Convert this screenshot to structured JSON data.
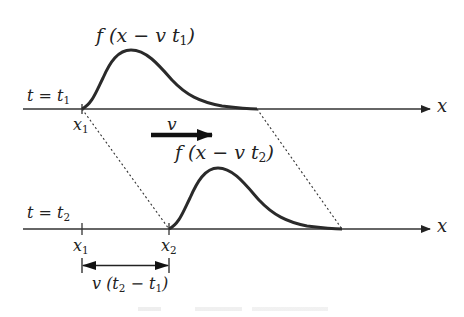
{
  "figure": {
    "colors": {
      "ink": "#222222",
      "background": "#ffffff"
    }
  },
  "time1": {
    "axis_label": "t = t",
    "axis_label_sub": "1",
    "x_axis_label": "x",
    "pulse_label_pre": "f (x − v t",
    "pulse_label_sub": "1",
    "pulse_label_post": ")",
    "tick_label": "x",
    "tick_label_sub": "1"
  },
  "velocity": {
    "label": "v"
  },
  "time2": {
    "axis_label": "t = t",
    "axis_label_sub": "2",
    "x_axis_label": "x",
    "pulse_label_pre": "f (x − v t",
    "pulse_label_sub": "2",
    "pulse_label_post": ")",
    "tick1_label": "x",
    "tick1_label_sub": "1",
    "tick2_label": "x",
    "tick2_label_sub": "2"
  },
  "displacement": {
    "label_pre": "v (t",
    "label_sub1": "2",
    "label_mid": " − t",
    "label_sub2": "1",
    "label_post": ")"
  }
}
